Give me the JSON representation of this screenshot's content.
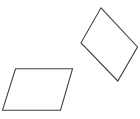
{
  "canvas": {
    "width": 140,
    "height": 119,
    "background_color": "#ffffff",
    "description": "Two outlined quadrilaterals (parallelograms) on a plain white background"
  },
  "figure": {
    "title": "",
    "shape_count": 2,
    "shapes": [
      {
        "id": "parallelogram-left",
        "name": "left-parallelogram",
        "type": "parallelogram",
        "stroke_color": "#3f3f3f",
        "fill_color": "none",
        "stroke_width": 1.1,
        "orientation": "horizontal slanted, leaning right",
        "points": "15.5,68.8 72.5,68.8 60.5,110.2 2.5,110.2",
        "vertices": [
          {
            "label": "top-left",
            "x": 15.5,
            "y": 68.8
          },
          {
            "label": "top-right",
            "x": 72.5,
            "y": 68.8
          },
          {
            "label": "bottom-right",
            "x": 60.5,
            "y": 110.2
          },
          {
            "label": "bottom-left",
            "x": 2.5,
            "y": 110.2
          }
        ]
      },
      {
        "id": "parallelogram-right",
        "name": "right-parallelogram",
        "type": "parallelogram",
        "stroke_color": "#3f3f3f",
        "fill_color": "none",
        "stroke_width": 1.1,
        "orientation": "rotated, diamond-like, upper right",
        "points": "101.0,7.8 137.5,47.0 117.8,81.0 81.0,42.8",
        "vertices": [
          {
            "label": "top",
            "x": 101.0,
            "y": 7.8
          },
          {
            "label": "right",
            "x": 137.5,
            "y": 47.0
          },
          {
            "label": "bottom",
            "x": 117.8,
            "y": 81.0
          },
          {
            "label": "left",
            "x": 81.0,
            "y": 42.8
          }
        ]
      }
    ]
  }
}
